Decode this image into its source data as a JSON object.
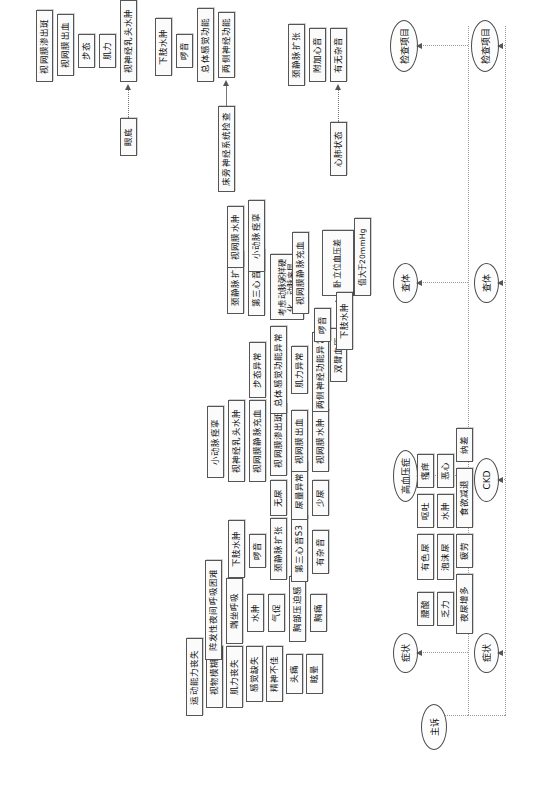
{
  "document": {
    "title": "高血压与慢性肾脏病临床路径流程图",
    "header_faint": "——————————————"
  },
  "lanes": {
    "chief_complaint": "主诉",
    "symptom": "症状",
    "exam": "查体",
    "exam_items": "检查项目"
  },
  "tracks": [
    {
      "id": "hypertension",
      "stage_label": "高血压症",
      "symptom_label": "症状",
      "exam_label": "查体",
      "exam_items_label": "检查项目"
    },
    {
      "id": "ckd",
      "stage_label": "CKD",
      "symptom_label": "症状",
      "exam_label": "查体",
      "exam_items_label": "检查项目"
    }
  ],
  "groups": {
    "complaint_general": {
      "name": "一般主诉",
      "items": [
        "眩晕",
        "头痛",
        "精神不佳",
        "感觉缺失",
        "肌力丧失",
        "视物模糊",
        "运动能力丧失"
      ]
    },
    "complaint_cardio": {
      "name": "心血管主诉",
      "items": [
        "胸痛",
        "胸部压迫感",
        "气促",
        "水肿",
        "端坐呼吸",
        "阵发性夜间呼吸困难"
      ]
    },
    "symptom_hypertension_signs": {
      "name": "高血压体征",
      "items": [
        "有杂音",
        "第三心音S3",
        "颈静脉扩张",
        "啰音",
        "下肢水肿"
      ]
    },
    "symptom_hypertension_lab": {
      "name": "高血压相关异常",
      "items": [
        "少尿",
        "尿量异常",
        "无尿",
        "视网膜水肿",
        "视网膜出血",
        "视网膜渗出斑",
        "视网膜静脉充血",
        "视神经乳头水肿",
        "小动脉痉挛",
        "两侧神经功能异常",
        "肌力异常",
        "总体感觉功能异常",
        "步态异常"
      ]
    },
    "exam_blood_pressure": {
      "name": "血压测量",
      "items": [
        "双臂血压"
      ],
      "findings": [
        "卧立位血压差",
        "值大于20mmHg"
      ]
    },
    "exam_heart_lung": {
      "name": "心肺状态",
      "items": [
        "心肺状态"
      ],
      "findings": [
        "有无杂音",
        "附加心音",
        "颈静脉扩张"
      ]
    },
    "exam_cardio_signs": {
      "name": "心血管体征",
      "items": [
        "考虑动脉粥样硬化、动脉夹层",
        "第三心音S3",
        "颈静脉扩张",
        "啰音",
        "下肢水肿",
        "小动脉痉挛",
        "视网膜水肿",
        "视网膜静脉充血"
      ]
    },
    "exam_neuro": {
      "name": "床旁神经系统检查",
      "items": [
        "床旁神经系统检查"
      ],
      "findings": [
        "两侧神经功能",
        "总体感觉功能",
        "啰音",
        "下肢水肿"
      ]
    },
    "exam_fundus": {
      "name": "眼底",
      "items": [
        "眼底"
      ],
      "findings": [
        "视神经乳头水肿",
        "肌力",
        "步态",
        "视网膜出血",
        "视网膜渗出斑"
      ]
    },
    "ckd_symptoms_row1": {
      "name": "CKD症状（一）",
      "items": [
        "泡沫尿",
        "有色尿",
        "水肿",
        "呕吐",
        "恶心",
        "瘙痒"
      ]
    },
    "ckd_symptoms_row2": {
      "name": "CKD症状（二）",
      "items": [
        "乏力",
        "腰酸",
        "夜尿增多",
        "疲劳",
        "食欲减退",
        "纳差"
      ]
    }
  },
  "colors": {
    "node_border": "#555555",
    "node_fill": "#fbfbfb",
    "lane_line": "#9b9b9b",
    "connector": "#777777",
    "text": "#111111"
  }
}
